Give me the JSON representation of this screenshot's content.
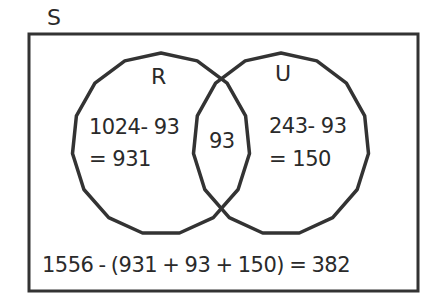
{
  "universe": {
    "label": "S",
    "total": 1556
  },
  "sets": [
    {
      "label": "R",
      "total": 1024
    },
    {
      "label": "U",
      "total": 243
    }
  ],
  "regions": {
    "r_only": {
      "line1": "1024- 93",
      "line2": "= 931"
    },
    "intersection": {
      "value": "93"
    },
    "u_only": {
      "line1": "243- 93",
      "line2": "= 150"
    }
  },
  "outside_formula": "1556 -  (931 + 93 + 150) = 382",
  "colors": {
    "stroke": "#333333",
    "text": "#2a2a2a",
    "background": "#ffffff"
  }
}
